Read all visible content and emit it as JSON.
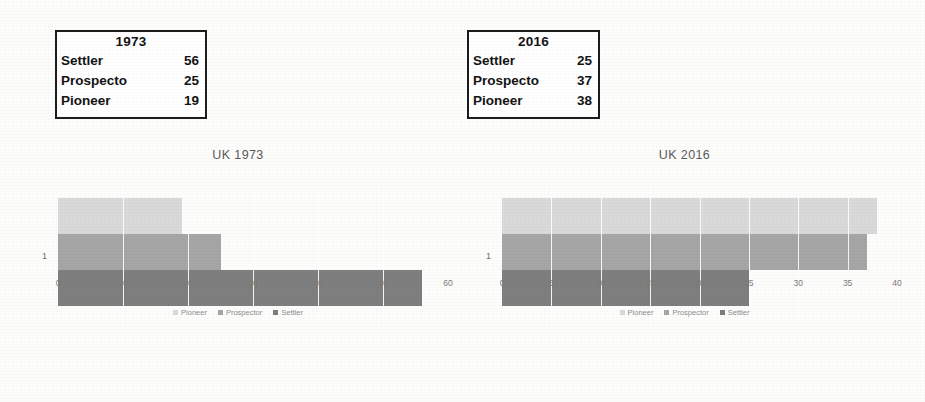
{
  "palette": {
    "pioneer": "#d9d9d9",
    "prospector": "#a6a6a6",
    "settler": "#7f7f7f",
    "table_border": "#1c1c1c",
    "title_text": "#5a5a5a",
    "tick_text": "#7a7a7a"
  },
  "tables": [
    {
      "name": "table-1973",
      "header": "1973",
      "rows": [
        {
          "category": "Settler",
          "value": "56"
        },
        {
          "category": "Prospecto",
          "value": "25"
        },
        {
          "category": "Pioneer",
          "value": "19"
        }
      ]
    },
    {
      "name": "table-2016",
      "header": "2016",
      "rows": [
        {
          "category": "Settler",
          "value": "25"
        },
        {
          "category": "Prospecto",
          "value": "37"
        },
        {
          "category": "Pioneer",
          "value": "38"
        }
      ]
    }
  ],
  "chart_data": [
    {
      "type": "bar",
      "orientation": "horizontal",
      "title": "UK 1973",
      "xlabel": "",
      "ylabel": "",
      "categories": [
        "1"
      ],
      "xlim": [
        0,
        60
      ],
      "xticks": [
        "0",
        "10",
        "20",
        "30",
        "40",
        "50",
        "60"
      ],
      "yticks": [
        "1"
      ],
      "grid": true,
      "legend_position": "bottom",
      "series": [
        {
          "name": "Pioneer",
          "values": [
            19
          ],
          "color": "#d9d9d9"
        },
        {
          "name": "Prospector",
          "values": [
            25
          ],
          "color": "#a6a6a6"
        },
        {
          "name": "Settler",
          "values": [
            56
          ],
          "color": "#7f7f7f"
        }
      ]
    },
    {
      "type": "bar",
      "orientation": "horizontal",
      "title": "UK 2016",
      "xlabel": "",
      "ylabel": "",
      "categories": [
        "1"
      ],
      "xlim": [
        0,
        40
      ],
      "xticks": [
        "0",
        "5",
        "10",
        "15",
        "20",
        "25",
        "30",
        "35",
        "40"
      ],
      "yticks": [
        "1"
      ],
      "grid": true,
      "legend_position": "bottom",
      "series": [
        {
          "name": "Pioneer",
          "values": [
            38
          ],
          "color": "#d9d9d9"
        },
        {
          "name": "Prospector",
          "values": [
            37
          ],
          "color": "#a6a6a6"
        },
        {
          "name": "Settler",
          "values": [
            25
          ],
          "color": "#7f7f7f"
        }
      ]
    }
  ]
}
